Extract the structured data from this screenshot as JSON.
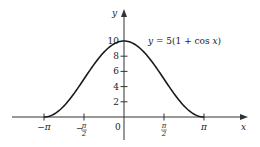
{
  "chart_data": {
    "type": "line",
    "title": "",
    "equation_label": "y = 5(1 + cos x)",
    "xlabel": "x",
    "ylabel": "y",
    "xlim": [
      -3.14159,
      3.14159
    ],
    "ylim": [
      0,
      10
    ],
    "x_ticks": [
      {
        "value": -3.14159,
        "label": "−π"
      },
      {
        "value": -1.5708,
        "label": "−π/2",
        "num": "π",
        "den": "2",
        "sign": "−"
      },
      {
        "value": 0,
        "label": "0"
      },
      {
        "value": 1.5708,
        "label": "π/2",
        "num": "π",
        "den": "2",
        "sign": ""
      },
      {
        "value": 3.14159,
        "label": "π"
      }
    ],
    "y_ticks": [
      2,
      4,
      6,
      8,
      10
    ],
    "y_tick_labels": [
      "2",
      "4",
      "6",
      "8",
      "10"
    ],
    "grid": false,
    "series": [
      {
        "name": "y = 5(1 + cos x)",
        "function": "5*(1+cos(x))",
        "x": [
          -3.1416,
          -2.7489,
          -2.3562,
          -1.9635,
          -1.5708,
          -1.1781,
          -0.7854,
          -0.3927,
          0,
          0.3927,
          0.7854,
          1.1781,
          1.5708,
          1.9635,
          2.3562,
          2.7489,
          3.1416
        ],
        "values": [
          0,
          0.38,
          1.46,
          3.09,
          5,
          6.91,
          8.54,
          9.62,
          10,
          9.62,
          8.54,
          6.91,
          5,
          3.09,
          1.46,
          0.38,
          0
        ]
      }
    ]
  },
  "colors": {
    "curve": "#1a1a1a",
    "axis": "#333333",
    "text": "#222222",
    "background": "#ffffff"
  }
}
